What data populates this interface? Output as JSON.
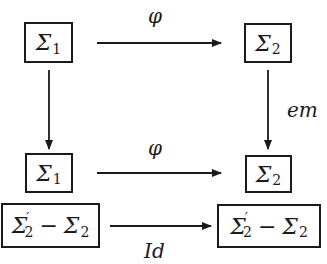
{
  "diagram": {
    "nodes": [
      {
        "id": "top-left",
        "symbol": "Σ",
        "sub": "1"
      },
      {
        "id": "top-right",
        "symbol": "Σ",
        "sub": "2"
      },
      {
        "id": "mid-left",
        "symbol": "Σ",
        "sub": "1"
      },
      {
        "id": "mid-right",
        "symbol": "Σ",
        "sub": "2"
      },
      {
        "id": "bottom-left",
        "symbol": "Σ",
        "sub": "2",
        "prime": "′",
        "minus": "−",
        "symbol2": "Σ",
        "sub2": "2"
      },
      {
        "id": "bottom-right",
        "symbol": "Σ",
        "sub": "2",
        "prime": "′",
        "minus": "−",
        "symbol2": "Σ",
        "sub2": "2"
      }
    ],
    "edges": [
      {
        "from": "top-left",
        "to": "top-right",
        "label": "φ"
      },
      {
        "from": "top-left",
        "to": "mid-left",
        "label": ""
      },
      {
        "from": "top-right",
        "to": "mid-right",
        "label": "em"
      },
      {
        "from": "mid-left",
        "to": "mid-right",
        "label": "φ"
      },
      {
        "from": "bottom-left",
        "to": "bottom-right",
        "label": "Id"
      }
    ]
  }
}
